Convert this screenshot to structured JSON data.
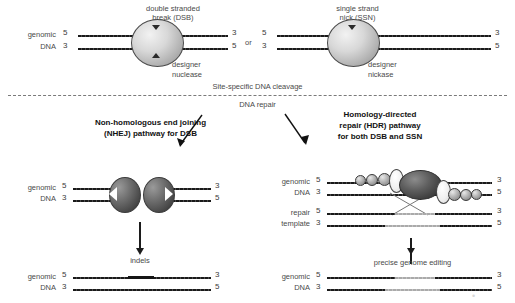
{
  "top_section": {
    "caption": "Site-specific DNA cleavage",
    "separator_or": "or",
    "dsb": {
      "title_line1": "double stranded",
      "title_line2": "break (DSB)",
      "enzyme_line1": "designer",
      "enzyme_line2": "nuclease",
      "row_label_line1": "genomic",
      "row_label_line2": "DNA",
      "left_top_tick": "5",
      "left_bottom_tick": "3",
      "right_top_tick": "3",
      "right_bottom_tick": "5"
    },
    "ssn": {
      "title_line1": "single strand",
      "title_line2": "nick (SSN)",
      "enzyme_line1": "designer",
      "enzyme_line2": "nickase",
      "left_top_tick": "5",
      "left_bottom_tick": "3",
      "right_top_tick": "3",
      "right_bottom_tick": "5"
    }
  },
  "repair_section": {
    "caption": "DNA repair",
    "nhej": {
      "title_line1": "Non-homologous end joining",
      "title_line2": "(NHEJ) pathway for DSB",
      "row_label_line1": "genomic",
      "row_label_line2": "DNA",
      "left_top_tick": "5",
      "left_bottom_tick": "3",
      "right_top_tick": "3",
      "right_bottom_tick": "5",
      "outcome_label": "indels",
      "outcome_row_label_line1": "genomic",
      "outcome_row_label_line2": "DNA",
      "outcome_left_top_tick": "5",
      "outcome_left_bottom_tick": "3",
      "outcome_right_top_tick": "3",
      "outcome_right_bottom_tick": "5"
    },
    "hdr": {
      "title_line1": "Homology-directed",
      "title_line2": "repair (HDR) pathway",
      "title_line3": "for both DSB and SSN",
      "genomic_label_line1": "genomic",
      "genomic_label_line2": "DNA",
      "genomic_left_top_tick": "5",
      "genomic_left_bottom_tick": "3",
      "genomic_right_top_tick": "3",
      "genomic_right_bottom_tick": "5",
      "template_label_line1": "repair",
      "template_label_line2": "template",
      "template_left_top_tick": "5",
      "template_left_bottom_tick": "3",
      "template_right_top_tick": "3",
      "template_right_bottom_tick": "5",
      "outcome_label": "precise genome editing",
      "outcome_row_label_line1": "genomic",
      "outcome_row_label_line2": "DNA",
      "outcome_left_top_tick": "5",
      "outcome_left_bottom_tick": "3",
      "outcome_right_top_tick": "3",
      "outcome_right_bottom_tick": "5"
    }
  },
  "colors": {
    "strand_dark": "#1a1a1a",
    "strand_gray": "#b0b0b0",
    "text": "#4a4a4a",
    "title_text": "#111111"
  }
}
